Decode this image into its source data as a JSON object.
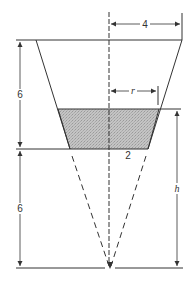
{
  "diagram": {
    "labels": {
      "top_radius": "4",
      "water_radius": "r",
      "bottom_radius": "2",
      "upper_height": "6",
      "lower_height": "6",
      "water_depth_from_apex": "h"
    },
    "colors": {
      "line": "#333333",
      "water_fill": "#b8b8b8",
      "background": "#ffffff"
    }
  }
}
